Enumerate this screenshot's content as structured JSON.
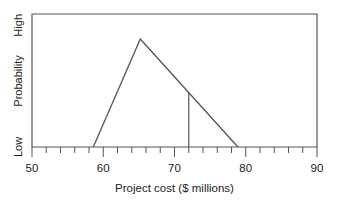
{
  "chart_data": {
    "type": "line",
    "title": "",
    "xlabel": "Project cost ($ millions)",
    "ylabel": "Probability",
    "xlim": [
      50,
      90
    ],
    "ylim_labels": {
      "low": "Low",
      "high": "High"
    },
    "x_major_ticks": [
      50,
      60,
      70,
      80,
      90
    ],
    "x_minor_step": 2,
    "grid": false,
    "series": [
      {
        "name": "Triangular distribution",
        "points": [
          {
            "x": 58.6,
            "y": 0
          },
          {
            "x": 65.2,
            "y": 1
          },
          {
            "x": 78.9,
            "y": 0
          }
        ]
      }
    ],
    "annotations": [
      {
        "type": "vertical-line",
        "x": 72,
        "note": "marker line from axis up to distribution curve"
      }
    ],
    "colors": {
      "line": "#555555",
      "frame": "#555555",
      "text": "#222222"
    }
  },
  "labels": {
    "x_axis": "Project cost ($ millions)",
    "y_axis": "Probability",
    "y_low": "Low",
    "y_high": "High",
    "ticks": [
      "50",
      "60",
      "70",
      "80",
      "90"
    ]
  }
}
